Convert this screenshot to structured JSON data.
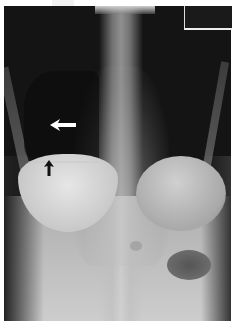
{
  "image": {
    "description": "Frontal chest radiograph showing an air-fluid level in the right hemithorax",
    "annotations": [
      {
        "type": "arrow",
        "color": "#ffffff",
        "direction": "left",
        "meaning": "air-fluid level region"
      },
      {
        "type": "arrow",
        "color": "#111111",
        "direction": "up",
        "meaning": "fluid level"
      }
    ]
  },
  "colors": {
    "background": "#141414",
    "border": "#ffffff",
    "arrow_white": "#ffffff",
    "arrow_black": "#111111"
  }
}
